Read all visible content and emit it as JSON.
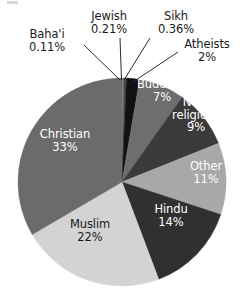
{
  "chart_data": {
    "type": "pie",
    "title": "",
    "subtitle": "",
    "xlabel": "",
    "ylabel": "",
    "legend_position": "none",
    "grid": false,
    "units": "percent",
    "start_angle_deg": 0,
    "direction": "clockwise",
    "categories": [
      "Baha'i",
      "Jewish",
      "Sikh",
      "Atheists",
      "Buddhist",
      "Non-religious",
      "Other",
      "Hindu",
      "Muslim",
      "Christian"
    ],
    "values": [
      0.11,
      0.21,
      0.36,
      2,
      7,
      9,
      11,
      14,
      22,
      33
    ],
    "value_labels": [
      "0.11%",
      "0.21%",
      "0.36%",
      "2%",
      "7%",
      "9%",
      "11%",
      "14%",
      "22%",
      "33%"
    ],
    "colors": [
      "#8f8f8f",
      "#6e6e6e",
      "#4a4a4a",
      "#121212",
      "#6e6e6e",
      "#3a3a3a",
      "#a8a8a8",
      "#303030",
      "#d3d3d3",
      "#6b6b6b"
    ],
    "slices": [
      {
        "label": "Baha'i",
        "value": 0.11,
        "value_label": "0.11%",
        "color": "#8f8f8f",
        "label_placement": "callout",
        "text_color": "#1a1a1a"
      },
      {
        "label": "Jewish",
        "value": 0.21,
        "value_label": "0.21%",
        "color": "#6e6e6e",
        "label_placement": "callout",
        "text_color": "#1a1a1a"
      },
      {
        "label": "Sikh",
        "value": 0.36,
        "value_label": "0.36%",
        "color": "#4a4a4a",
        "label_placement": "callout",
        "text_color": "#1a1a1a"
      },
      {
        "label": "Atheists",
        "value": 2,
        "value_label": "2%",
        "color": "#121212",
        "label_placement": "callout",
        "text_color": "#1a1a1a"
      },
      {
        "label": "Buddhist",
        "value": 7,
        "value_label": "7%",
        "color": "#6e6e6e",
        "label_placement": "inside",
        "text_color": "#ffffff"
      },
      {
        "label": "Non-religious",
        "value": 9,
        "value_label": "9%",
        "color": "#3a3a3a",
        "label_placement": "inside",
        "text_color": "#ffffff"
      },
      {
        "label": "Other",
        "value": 11,
        "value_label": "11%",
        "color": "#a8a8a8",
        "label_placement": "inside",
        "text_color": "#ffffff"
      },
      {
        "label": "Hindu",
        "value": 14,
        "value_label": "14%",
        "color": "#303030",
        "label_placement": "inside",
        "text_color": "#ffffff"
      },
      {
        "label": "Muslim",
        "value": 22,
        "value_label": "22%",
        "color": "#d3d3d3",
        "label_placement": "inside",
        "text_color": "#1a1a1a"
      },
      {
        "label": "Christian",
        "value": 33,
        "value_label": "33%",
        "color": "#6b6b6b",
        "label_placement": "inside",
        "text_color": "#ffffff"
      }
    ]
  },
  "labels": {
    "bahai": {
      "name": "Baha'i",
      "value": "0.11%"
    },
    "jewish": {
      "name": "Jewish",
      "value": "0.21%"
    },
    "sikh": {
      "name": "Sikh",
      "value": "0.36%"
    },
    "atheists": {
      "name": "Atheists",
      "value": "2%"
    },
    "buddhist": {
      "name": "Buddhist",
      "value": "7%"
    },
    "nonreligious": {
      "name": "Non-",
      "name2": "religious",
      "value": "9%"
    },
    "other": {
      "name": "Other",
      "value": "11%"
    },
    "hindu": {
      "name": "Hindu",
      "value": "14%"
    },
    "muslim": {
      "name": "Muslim",
      "value": "22%"
    },
    "christian": {
      "name": "Christian",
      "value": "33%"
    }
  },
  "geometry": {
    "center_x": 122,
    "center_y": 182,
    "radius": 104
  }
}
